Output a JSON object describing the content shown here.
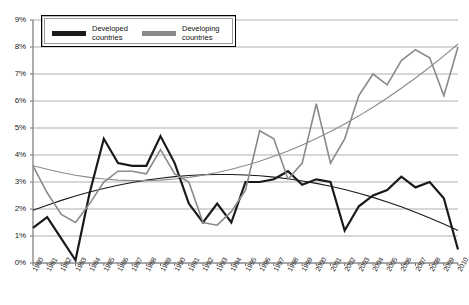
{
  "chart_data": {
    "type": "line",
    "title": "",
    "xlabel": "",
    "ylabel": "",
    "ylim": [
      0,
      9
    ],
    "ytick_labels": [
      "0%",
      "1%",
      "2%",
      "3%",
      "4%",
      "5%",
      "6%",
      "7%",
      "8%",
      "9%"
    ],
    "ytick_values": [
      0,
      1,
      2,
      3,
      4,
      5,
      6,
      7,
      8,
      9
    ],
    "grid": true,
    "legend_position": "top-inside",
    "x": [
      "1980",
      "1981",
      "1982",
      "1983",
      "1984",
      "1985",
      "1986",
      "1987",
      "1988",
      "1989",
      "1990",
      "1991",
      "1992",
      "1993",
      "1994",
      "1995",
      "1996",
      "1997",
      "1998",
      "1999",
      "2000",
      "2001",
      "2002",
      "2003",
      "2004",
      "2005",
      "2006",
      "2007",
      "2008",
      "2009",
      "2010"
    ],
    "series": [
      {
        "name": "Developed countries",
        "color": "#1a1a1a",
        "values": [
          1.3,
          1.7,
          0.9,
          0.1,
          2.6,
          4.6,
          3.7,
          3.6,
          3.6,
          4.7,
          3.7,
          2.2,
          1.5,
          2.2,
          1.5,
          3.0,
          3.0,
          3.1,
          3.4,
          2.9,
          3.1,
          3.0,
          1.2,
          2.1,
          2.5,
          2.7,
          3.2,
          2.8,
          3.0,
          2.4,
          0.5
        ]
      },
      {
        "name": "Developing countries",
        "color": "#8a8a8a",
        "values": [
          3.6,
          2.6,
          1.8,
          1.5,
          2.2,
          3.0,
          3.4,
          3.4,
          3.3,
          4.2,
          3.3,
          3.0,
          1.5,
          1.4,
          1.9,
          2.7,
          4.9,
          4.6,
          3.1,
          3.7,
          5.9,
          3.7,
          4.6,
          6.2,
          7.0,
          6.6,
          7.5,
          7.9,
          7.6,
          6.2,
          8.0
        ]
      }
    ],
    "trendlines": [
      {
        "name": "Developed countries trend",
        "color": "#1a1a1a",
        "values": [
          1.95,
          2.14,
          2.32,
          2.48,
          2.63,
          2.76,
          2.88,
          2.98,
          3.07,
          3.14,
          3.2,
          3.24,
          3.27,
          3.28,
          3.28,
          3.26,
          3.23,
          3.18,
          3.12,
          3.04,
          2.95,
          2.84,
          2.72,
          2.58,
          2.43,
          2.26,
          2.08,
          1.88,
          1.67,
          1.44,
          1.2
        ]
      },
      {
        "name": "Developing countries trend",
        "color": "#8a8a8a",
        "values": [
          3.6,
          3.47,
          3.35,
          3.25,
          3.17,
          3.11,
          3.07,
          3.05,
          3.05,
          3.07,
          3.11,
          3.17,
          3.25,
          3.35,
          3.47,
          3.61,
          3.77,
          3.95,
          4.15,
          4.37,
          4.61,
          4.87,
          5.15,
          5.45,
          5.77,
          6.11,
          6.47,
          6.85,
          7.25,
          7.67,
          8.11
        ]
      }
    ]
  },
  "legend": {
    "items": [
      {
        "label_line1": "Developed",
        "label_line2": "countries",
        "color": "#1a1a1a"
      },
      {
        "label_line1": "Developing",
        "label_line2": "countries",
        "color": "#8a8a8a"
      }
    ]
  }
}
